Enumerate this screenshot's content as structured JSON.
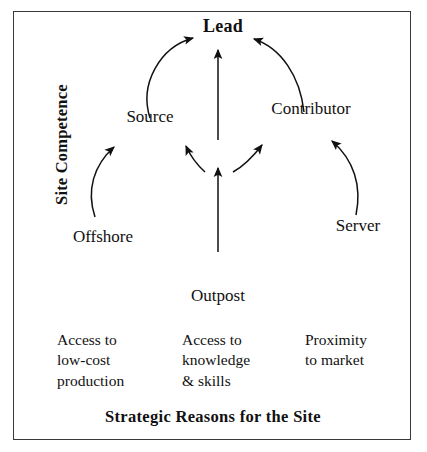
{
  "diagram": {
    "title_bottom": "Strategic Reasons for the Site",
    "axis_label_left": "Site Competence",
    "nodes": [
      {
        "id": "lead",
        "label": "Lead",
        "tier": "top"
      },
      {
        "id": "source",
        "label": "Source",
        "tier": "upper-left"
      },
      {
        "id": "contributor",
        "label": "Contributor",
        "tier": "upper-right"
      },
      {
        "id": "offshore",
        "label": "Offshore",
        "tier": "lower-left"
      },
      {
        "id": "server",
        "label": "Server",
        "tier": "lower-right"
      },
      {
        "id": "outpost",
        "label": "Outpost",
        "tier": "bottom-center"
      }
    ],
    "arrows": [
      {
        "from": "source",
        "to": "lead",
        "style": "arc"
      },
      {
        "from": "contributor",
        "to": "lead",
        "style": "arc"
      },
      {
        "from": "outpost",
        "to": "lead",
        "style": "straight"
      },
      {
        "from": "outpost",
        "to": "source",
        "style": "arc"
      },
      {
        "from": "outpost",
        "to": "contributor",
        "style": "arc"
      },
      {
        "from": "offshore",
        "to": "source",
        "style": "arc"
      },
      {
        "from": "server",
        "to": "contributor",
        "style": "arc"
      }
    ],
    "reasons": [
      {
        "id": "reason-left",
        "text": "Access to\nlow-cost\nproduction"
      },
      {
        "id": "reason-center",
        "text": "Access to\nknowledge\n& skills"
      },
      {
        "id": "reason-right",
        "text": "Proximity\nto market"
      }
    ],
    "colors": {
      "ink": "#111111",
      "frame": "#3a3a3a",
      "background": "#ffffff"
    }
  }
}
